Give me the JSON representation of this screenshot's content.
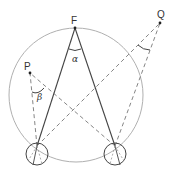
{
  "diagram": {
    "type": "geometry-vision-angles",
    "labels": {
      "fixation": "F",
      "point_p": "P",
      "point_q": "Q",
      "angle_alpha": "α",
      "angle_beta": "β"
    },
    "colors": {
      "circle": "#b0b0b0",
      "solid_lines": "#444444",
      "dashed_lines": "#777777",
      "text": "#333333"
    },
    "elements": [
      "Vieth-Müller circle through fixation point F and both eyes",
      "Solid lines from each eye to F forming angle α",
      "Dashed lines from each eye to P forming angle β",
      "Dashed lines from each eye to Q forming an angle",
      "Left eye and right eye drawn as small circles"
    ]
  }
}
